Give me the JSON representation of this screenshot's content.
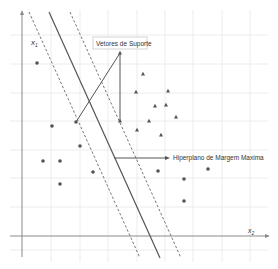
{
  "diagram": {
    "axes": {
      "x_label": "x",
      "x_sub": "2",
      "y_label": "x",
      "y_sub": "1"
    },
    "annotations": {
      "support_vectors": "Vetores de Suporte",
      "hyperplane": "Hiperplano de Margem Maxima"
    },
    "colors": {
      "grid": "#ececec",
      "axis": "#8a8a8a",
      "line": "#555555",
      "point": "#555555",
      "box_border": "#c8c8c8"
    },
    "circles": [
      {
        "x": 37,
        "y": 63
      },
      {
        "x": 52,
        "y": 126
      },
      {
        "x": 76,
        "y": 122
      },
      {
        "x": 43,
        "y": 161
      },
      {
        "x": 60,
        "y": 161
      },
      {
        "x": 80,
        "y": 146
      },
      {
        "x": 93,
        "y": 172
      },
      {
        "x": 60,
        "y": 184
      },
      {
        "x": 158,
        "y": 171
      },
      {
        "x": 184,
        "y": 179
      },
      {
        "x": 208,
        "y": 169
      },
      {
        "x": 184,
        "y": 201
      }
    ],
    "triangles": [
      {
        "x": 120,
        "y": 53
      },
      {
        "x": 143,
        "y": 74
      },
      {
        "x": 136,
        "y": 92
      },
      {
        "x": 168,
        "y": 91
      },
      {
        "x": 155,
        "y": 106
      },
      {
        "x": 166,
        "y": 105
      },
      {
        "x": 176,
        "y": 117
      },
      {
        "x": 149,
        "y": 121
      },
      {
        "x": 120,
        "y": 121
      },
      {
        "x": 137,
        "y": 130
      },
      {
        "x": 161,
        "y": 135
      }
    ]
  }
}
